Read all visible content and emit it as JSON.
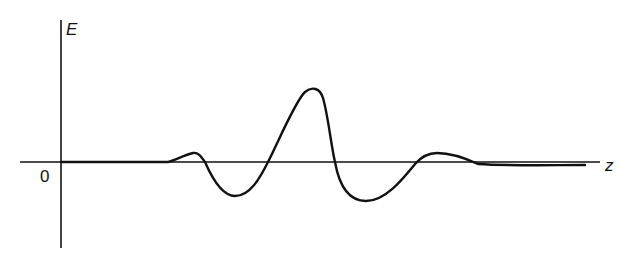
{
  "diagram": {
    "title": "",
    "axes": {
      "y_label": "E",
      "x_label": "z",
      "origin_label": "0"
    },
    "colors": {
      "stroke": "#111111",
      "background": "#ffffff"
    },
    "curve": {
      "description": "Oscillating wave packet along z: flat, small positive bump, negative trough, large positive peak, negative trough, small positive bump, decays to zero",
      "key_points": [
        {
          "z": 168,
          "E": 0
        },
        {
          "z": 193,
          "E": 9,
          "kind": "small-max"
        },
        {
          "z": 205,
          "E": 0
        },
        {
          "z": 235,
          "E": -34,
          "kind": "min"
        },
        {
          "z": 268,
          "E": 0
        },
        {
          "z": 314,
          "E": 72,
          "kind": "max"
        },
        {
          "z": 335,
          "E": 0
        },
        {
          "z": 366,
          "E": -39,
          "kind": "min"
        },
        {
          "z": 415,
          "E": 0
        },
        {
          "z": 437,
          "E": 9,
          "kind": "small-max"
        },
        {
          "z": 478,
          "E": -2
        },
        {
          "z": 585,
          "E": -3
        }
      ]
    }
  }
}
